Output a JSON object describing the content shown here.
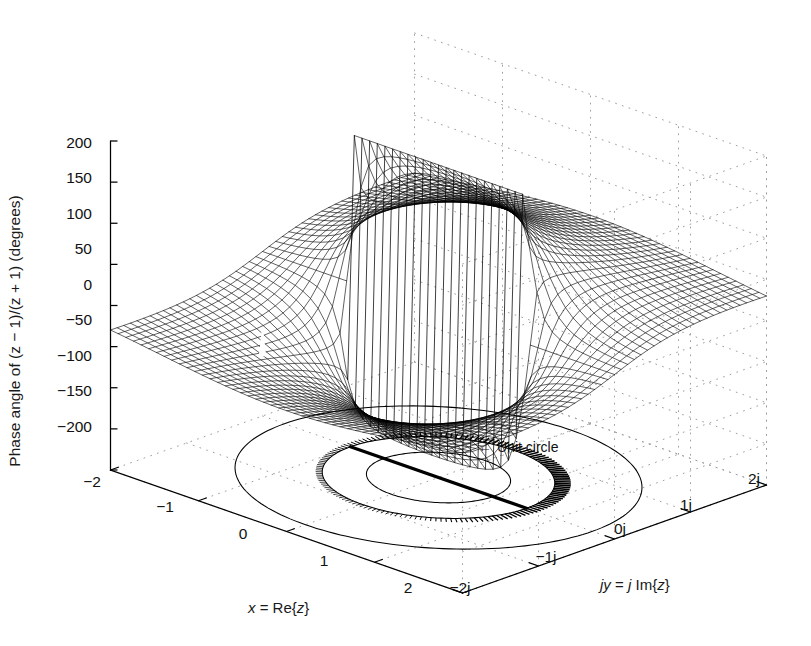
{
  "figure": {
    "background_color": "#ffffff",
    "line_color": "#000000",
    "grid_color": "#9a9a9a",
    "width": 811,
    "height": 646
  },
  "labels": {
    "z_axis": "Phase angle of (z − 1)/(z + 1) (degrees)",
    "x_axis_plain": "x = Re{z}",
    "y_axis_plain": "jy = j Im{z}",
    "x_axis_parts": {
      "var": "x",
      "eq": " = Re{",
      "var2": "z",
      "close": "}"
    },
    "y_axis_parts": {
      "var": "jy",
      "eq": " = ",
      "j": "j",
      "im": " Im{",
      "var2": "z",
      "close": "}"
    }
  },
  "annotations": [
    {
      "name": "unit-circle",
      "text": "Unit circle",
      "arrow": "←",
      "x": 492,
      "y": 447
    }
  ],
  "chart_data": {
    "type": "surface",
    "title": "",
    "subtitle": "",
    "function": "angle((z-1)/(z+1)) in degrees",
    "xlabel": "x = Re{z}",
    "ylabel": "jy = j Im{z}",
    "zlabel": "Phase angle of (z − 1)/(z + 1) (degrees)",
    "xlim": [
      -2,
      2
    ],
    "ylim": [
      -2,
      2
    ],
    "zlim": [
      -200,
      200
    ],
    "xticks": [
      -2,
      -1,
      0,
      1,
      2
    ],
    "xticklabels": [
      "−2",
      "−1",
      "0",
      "1",
      "2"
    ],
    "yticks": [
      -2,
      -1,
      0,
      1,
      2
    ],
    "yticklabels": [
      "−2j",
      "−1j",
      "0j",
      "1j",
      "2j"
    ],
    "zticks": [
      -200,
      -150,
      -100,
      -50,
      0,
      50,
      100,
      150,
      200
    ],
    "zticklabels": [
      "−200",
      "−150",
      "−100",
      "−50",
      "0",
      "50",
      "100",
      "150",
      "200"
    ],
    "grid": true,
    "grid_style": "dotted",
    "legend": "none",
    "mesh_color": "#000000",
    "mesh_resolution": 46,
    "poles": [
      {
        "name": "zero",
        "x": 1,
        "y": 0
      },
      {
        "name": "pole",
        "x": -1,
        "y": 0
      }
    ],
    "floor_features": [
      {
        "name": "unit-circle-projection",
        "radius": 1,
        "center": [
          0,
          0
        ]
      },
      {
        "name": "contour-ellipse-outer",
        "radius": 1.75,
        "center": [
          0,
          0
        ]
      },
      {
        "name": "contour-ellipse-inner",
        "radius": 0.62,
        "center": [
          0,
          0
        ]
      },
      {
        "name": "branch-cut-segment",
        "from": [
          -1,
          0
        ],
        "to": [
          1,
          0
        ]
      }
    ],
    "view": {
      "azimuth": -37.5,
      "elevation": 30
    }
  },
  "tick_positions": {
    "z": [
      {
        "label": "200",
        "x": 92,
        "y": 148
      },
      {
        "label": "150",
        "x": 92,
        "y": 183
      },
      {
        "label": "100",
        "x": 92,
        "y": 219
      },
      {
        "label": "50",
        "x": 92,
        "y": 254
      },
      {
        "label": "0",
        "x": 92,
        "y": 290
      },
      {
        "label": "−50",
        "x": 92,
        "y": 325
      },
      {
        "label": "−100",
        "x": 92,
        "y": 361
      },
      {
        "label": "−150",
        "x": 92,
        "y": 396
      },
      {
        "label": "−200",
        "x": 92,
        "y": 432
      }
    ],
    "x": [
      {
        "label": "−2",
        "x": 92,
        "y": 487
      },
      {
        "label": "−1",
        "x": 165,
        "y": 512
      },
      {
        "label": "0",
        "x": 243,
        "y": 539
      },
      {
        "label": "1",
        "x": 324,
        "y": 566
      },
      {
        "label": "2",
        "x": 408,
        "y": 593
      }
    ],
    "y": [
      {
        "label": "−2j",
        "x": 460,
        "y": 593
      },
      {
        "label": "−1j",
        "x": 546,
        "y": 562
      },
      {
        "label": "0j",
        "x": 620,
        "y": 534
      },
      {
        "label": "1j",
        "x": 686,
        "y": 510
      },
      {
        "label": "2j",
        "x": 754,
        "y": 484
      }
    ]
  }
}
